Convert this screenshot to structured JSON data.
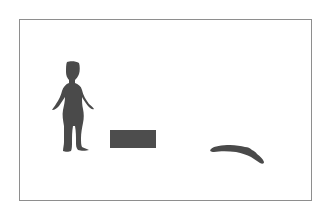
{
  "figure": {
    "description": "Silhouette diagram: standing human figure, a rectangular block, and a lying elongated shape inside a bordered frame",
    "colors": {
      "frame_border": "#8e8e8e",
      "silhouette_fill": "#4a4a4a",
      "block_fill": "#4d4d4d",
      "background": "#ffffff"
    },
    "elements": [
      {
        "name": "standing-human-silhouette",
        "label": "Standing figure"
      },
      {
        "name": "rectangle-block",
        "label": "Block"
      },
      {
        "name": "lying-shape-silhouette",
        "label": "Lying shape"
      }
    ]
  }
}
